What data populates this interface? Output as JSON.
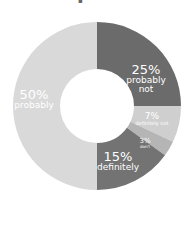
{
  "chart_data": {
    "type": "pie",
    "subtype": "donut",
    "title": "",
    "start_angle": "12 o'clock, clockwise",
    "categories": [
      "probably not",
      "definitely not",
      "don't know",
      "definitely",
      "probably"
    ],
    "values": [
      25,
      7,
      3,
      15,
      50
    ],
    "labels": [
      "25%",
      "7%",
      "3%",
      "15%",
      "50%"
    ],
    "colors": [
      "#6b6b6b",
      "#cfcfcf",
      "#b5b5b5",
      "#737373",
      "#d9d9d9"
    ],
    "label_color": "#ffffff",
    "legend": "none (labels on slices)"
  },
  "slices": [
    {
      "pct": "25%",
      "caption": "probably",
      "caption2": "not"
    },
    {
      "pct": "7%",
      "caption": "definitely not"
    },
    {
      "pct": "3%",
      "caption": "don't"
    },
    {
      "pct": "15%",
      "caption": "definitely"
    },
    {
      "pct": "50%",
      "caption": "probably"
    }
  ]
}
